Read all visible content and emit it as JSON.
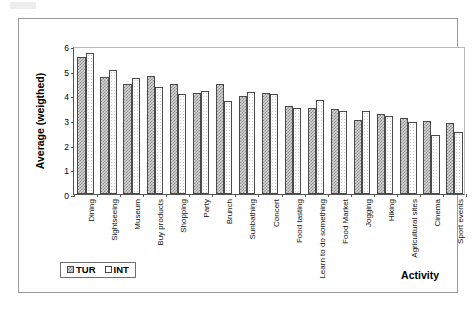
{
  "chart_data": {
    "type": "bar",
    "title": "",
    "xlabel": "Activity",
    "ylabel": "Average (weigthed)",
    "ylim": [
      0,
      6
    ],
    "yticks": [
      0,
      1,
      2,
      3,
      4,
      5,
      6
    ],
    "ytick_labels": [
      "0",
      "1",
      "2",
      "3",
      "4",
      "5",
      "6"
    ],
    "grid": false,
    "legend_position": "bottom-left",
    "categories": [
      "Dining",
      "Sightseeing",
      "Museum",
      "Buy products",
      "Shopping",
      "Party",
      "Brunch",
      "Sunbathing",
      "Concert",
      "Food tasting",
      "Learn to do something",
      "Food Market",
      "Jogging",
      "Hiking",
      "Agricultural sites",
      "Cinema",
      "Sport events"
    ],
    "series": [
      {
        "name": "TUR",
        "color": "#d6d6d6",
        "values": [
          5.55,
          4.75,
          4.47,
          4.77,
          4.45,
          4.08,
          4.47,
          3.97,
          4.08,
          3.55,
          3.47,
          3.45,
          3.0,
          3.25,
          3.07,
          2.95,
          2.88
        ]
      },
      {
        "name": "INT",
        "color": "#ffffff",
        "values": [
          5.7,
          5.02,
          4.72,
          4.35,
          4.07,
          4.17,
          3.78,
          4.13,
          4.05,
          3.5,
          3.8,
          3.38,
          3.35,
          3.15,
          2.9,
          2.4,
          2.5
        ]
      }
    ]
  },
  "axis": {
    "y_title": "Average (weigthed)",
    "x_title": "Activity"
  },
  "legend": {
    "entries": [
      {
        "label": "TUR",
        "swatch": "legend-swatch-tur"
      },
      {
        "label": "INT",
        "swatch": "legend-swatch-int"
      }
    ]
  }
}
